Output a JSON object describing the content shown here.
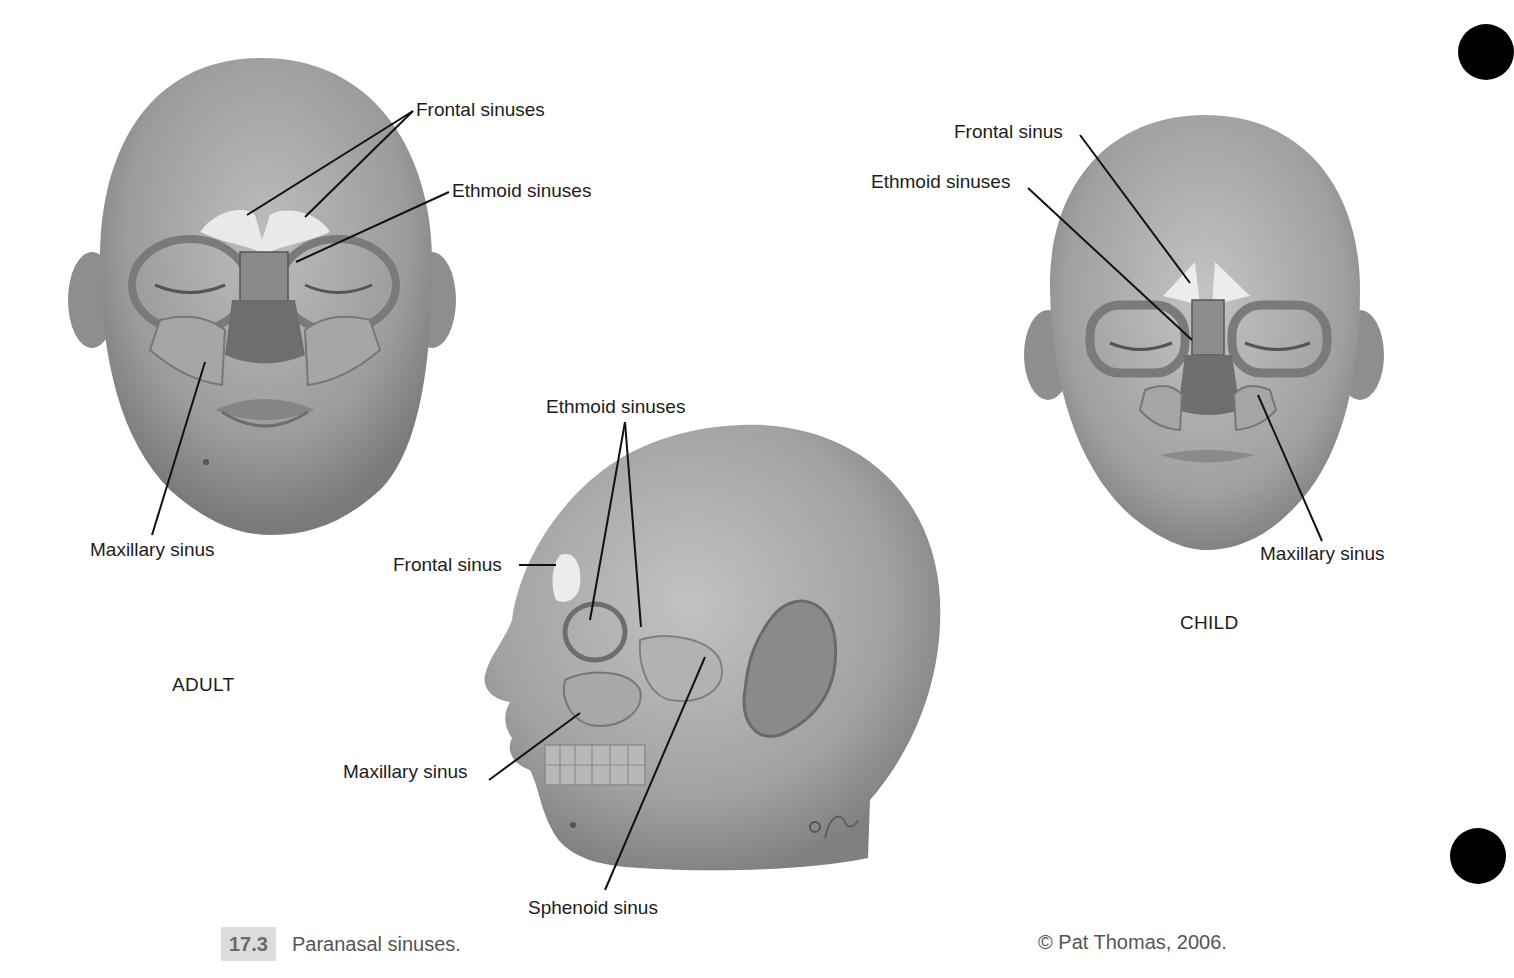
{
  "figure": {
    "number": "17.3",
    "title": "Paranasal sinuses.",
    "copyright": "© Pat Thomas, 2006.",
    "panels": {
      "adult": {
        "group_label": "ADULT",
        "labels": {
          "frontal": "Frontal sinuses",
          "ethmoid": "Ethmoid sinuses",
          "maxillary": "Maxillary sinus"
        }
      },
      "lateral": {
        "labels": {
          "ethmoid": "Ethmoid sinuses",
          "frontal": "Frontal sinus",
          "maxillary": "Maxillary sinus",
          "sphenoid": "Sphenoid sinus"
        }
      },
      "child": {
        "group_label": "CHILD",
        "labels": {
          "frontal": "Frontal sinus",
          "ethmoid": "Ethmoid sinuses",
          "maxillary": "Maxillary sinus"
        }
      }
    }
  },
  "colors": {
    "skin_light": "#b8b8b8",
    "skin_dark": "#7d7d7d",
    "sinus_highlight": "#ececec",
    "leader_line": "#111111",
    "caption_box": "#dcdcdc",
    "tab_marker": "#000000"
  }
}
